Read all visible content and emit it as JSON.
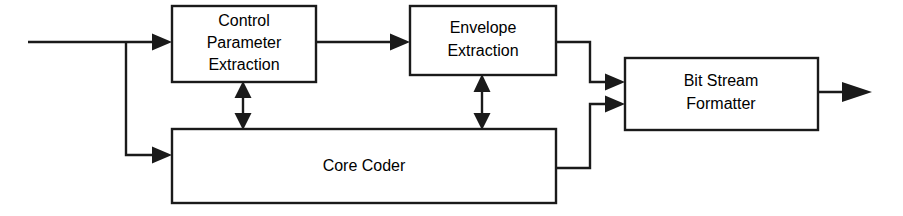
{
  "diagram": {
    "background_color": "#ffffff",
    "line_color": "#1a1a1a",
    "text_color": "#000000",
    "blocks": [
      {
        "id": "control-parameter-extraction",
        "lines": [
          "Control",
          "Parameter",
          "Extraction"
        ],
        "x": 172,
        "y": 6,
        "w": 144,
        "h": 76
      },
      {
        "id": "envelope-extraction",
        "lines": [
          "Envelope",
          "Extraction"
        ],
        "x": 410,
        "y": 6,
        "w": 146,
        "h": 69
      },
      {
        "id": "core-coder",
        "lines": [
          "Core Coder"
        ],
        "x": 172,
        "y": 129,
        "w": 384,
        "h": 74
      },
      {
        "id": "bit-stream-formatter",
        "lines": [
          "Bit Stream",
          "Formatter"
        ],
        "x": 625,
        "y": 58,
        "w": 193,
        "h": 72
      }
    ],
    "connections": [
      {
        "id": "input-signal",
        "label": "input to control parameter extraction"
      },
      {
        "id": "input-branch-to-core-coder",
        "label": "input branch to core coder"
      },
      {
        "id": "cpe-to-envelope",
        "label": "control parameter extraction to envelope extraction"
      },
      {
        "id": "cpe-core-bidirectional",
        "label": "control parameter extraction and core coder bidirectional"
      },
      {
        "id": "envelope-core-bidirectional",
        "label": "envelope extraction and core coder bidirectional"
      },
      {
        "id": "envelope-to-formatter",
        "label": "envelope extraction to bit stream formatter"
      },
      {
        "id": "core-to-formatter",
        "label": "core coder to bit stream formatter"
      },
      {
        "id": "formatter-output",
        "label": "bit stream formatter output"
      }
    ]
  }
}
